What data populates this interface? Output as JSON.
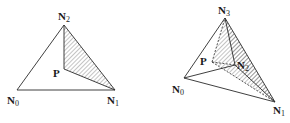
{
  "figure": {
    "left": {
      "title": "2D triangle subdivision",
      "vertices": {
        "N0": {
          "label": "N",
          "sub": "0",
          "x": 17,
          "y": 90
        },
        "N1": {
          "label": "N",
          "sub": "1",
          "x": 115,
          "y": 90
        },
        "N2": {
          "label": "N",
          "sub": "2",
          "x": 64,
          "y": 25
        },
        "P": {
          "label": "P",
          "x": 64,
          "y": 69
        }
      },
      "hatched_region": [
        "P",
        "N1",
        "N2"
      ]
    },
    "right": {
      "title": "3D tetrahedron subdivision",
      "vertices": {
        "N0": {
          "label": "N",
          "sub": "0",
          "x": 184,
          "y": 78
        },
        "N1": {
          "label": "N",
          "sub": "1",
          "x": 275,
          "y": 102
        },
        "N2": {
          "label": "N",
          "sub": "2",
          "x": 235,
          "y": 65
        },
        "N3": {
          "label": "N",
          "sub": "3",
          "x": 225,
          "y": 18
        },
        "P": {
          "label": "P",
          "x": 212,
          "y": 62
        }
      },
      "hatched_region": [
        "P",
        "N1",
        "N2",
        "N3"
      ]
    },
    "colors": {
      "line": "#2a2a2a",
      "hatch": "#555555",
      "background": "#ffffff"
    }
  }
}
